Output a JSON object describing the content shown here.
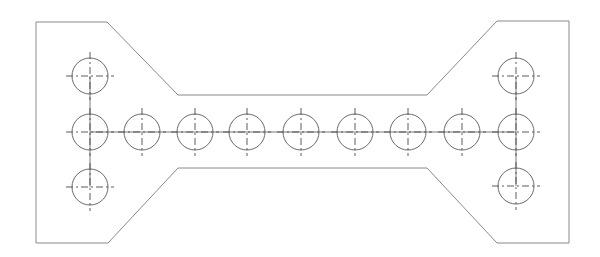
{
  "drawing": {
    "type": "plate-with-bolt-holes",
    "background": "#ffffff",
    "outline_color": "#8a8a8a",
    "hole_color": "#6a6a6a",
    "outline_points": [
      [
        36,
        22
      ],
      [
        107,
        22
      ],
      [
        178,
        95
      ],
      [
        427,
        95
      ],
      [
        497,
        21
      ],
      [
        569,
        21
      ],
      [
        569,
        243
      ],
      [
        497,
        243
      ],
      [
        427,
        168
      ],
      [
        178,
        168
      ],
      [
        108,
        243
      ],
      [
        36,
        243
      ]
    ],
    "hole_radius": 18,
    "holes": [
      {
        "x": 90,
        "y": 76
      },
      {
        "x": 90,
        "y": 132
      },
      {
        "x": 90,
        "y": 187
      },
      {
        "x": 142,
        "y": 132
      },
      {
        "x": 195,
        "y": 132
      },
      {
        "x": 247,
        "y": 132
      },
      {
        "x": 301,
        "y": 132
      },
      {
        "x": 355,
        "y": 132
      },
      {
        "x": 408,
        "y": 132
      },
      {
        "x": 462,
        "y": 132
      },
      {
        "x": 516,
        "y": 76
      },
      {
        "x": 516,
        "y": 132
      },
      {
        "x": 516,
        "y": 186
      }
    ],
    "links": [
      [
        [
          90,
          76
        ],
        [
          90,
          187
        ]
      ],
      [
        [
          90,
          132
        ],
        [
          516,
          132
        ]
      ],
      [
        [
          516,
          76
        ],
        [
          516,
          186
        ]
      ]
    ]
  }
}
